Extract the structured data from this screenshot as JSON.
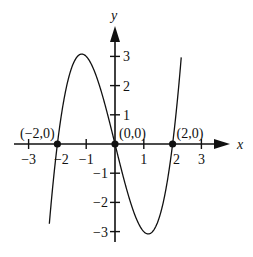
{
  "chart_data": {
    "type": "line",
    "title": "",
    "function": "y = x^3 - 4x",
    "xlabel": "x",
    "ylabel": "y",
    "xlim": [
      -3.2,
      3.9
    ],
    "ylim": [
      -3.4,
      4.0
    ],
    "grid": false,
    "x_ticks": [
      -3,
      -2,
      -1,
      1,
      2,
      3
    ],
    "y_ticks": [
      -3,
      -2,
      -1,
      1,
      2,
      3
    ],
    "x_tick_labels": [
      "−3",
      "−2",
      "−1",
      "1",
      "2",
      "3"
    ],
    "y_tick_labels": [
      "−3",
      "−2",
      "−1",
      "1",
      "2",
      "3"
    ],
    "points": [
      {
        "x": -2,
        "y": 0,
        "label": "(−2,0)"
      },
      {
        "x": 0,
        "y": 0,
        "label": "(0,0)"
      },
      {
        "x": 2,
        "y": 0,
        "label": "(2,0)"
      }
    ],
    "curve_samples": {
      "x": [
        -2.4,
        -2,
        -1.5,
        -1,
        -0.5,
        0,
        0.5,
        1,
        1.5,
        2,
        2.25
      ],
      "y": [
        -4.22,
        0,
        2.625,
        3,
        1.875,
        0,
        -1.875,
        -3,
        -2.625,
        0,
        2.39
      ]
    },
    "local_max": {
      "x": -1,
      "y": 3
    },
    "local_min": {
      "x": 1,
      "y": -3
    }
  }
}
